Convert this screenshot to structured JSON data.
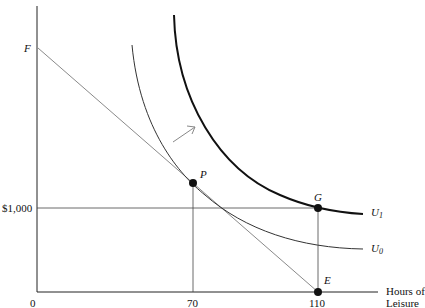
{
  "diagram": {
    "type": "labor-leisure indifference curves",
    "x_axis": {
      "label_line1": "Hours of",
      "label_line2": "Leisure",
      "ticks": [
        "0",
        "70",
        "110"
      ]
    },
    "y_axis": {
      "ticks": [
        "$1,000"
      ],
      "intercept_label": "F"
    },
    "points": {
      "P": "P",
      "G": "G",
      "E": "E"
    },
    "curves": {
      "U0": {
        "base": "U",
        "sub": "0"
      },
      "U1": {
        "base": "U",
        "sub": "1"
      }
    },
    "annotations": [
      "arrow indicating shift from U0 to U1"
    ]
  },
  "colors": {
    "axis": "#222222",
    "budget_line": "#8a8a8a",
    "u0": "#333333",
    "u1": "#111111",
    "guide_lines": "#444444",
    "arrow": "#888888"
  }
}
